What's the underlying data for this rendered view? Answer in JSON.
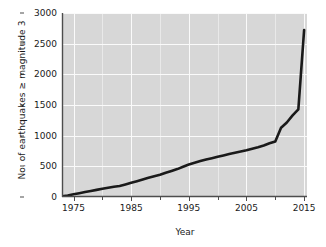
{
  "chart_data": {
    "type": "line",
    "title": "",
    "xlabel": "Year",
    "ylabel": "No. of earthquakes ≥ magnitude 3",
    "xlim": [
      1973,
      2015.5
    ],
    "ylim": [
      0,
      3000
    ],
    "grid": true,
    "legend": null,
    "xticks": [
      1975,
      1985,
      1995,
      2005,
      2015
    ],
    "xticklabels": [
      "1975",
      "1985",
      "1995",
      "2005",
      "2015"
    ],
    "xminorticks": [
      1980,
      1990,
      2000,
      2010
    ],
    "yticks": [
      0,
      500,
      1000,
      1500,
      2000,
      2500,
      3000
    ],
    "yticklabels": [
      "0",
      "500",
      "1000",
      "1500",
      "2000",
      "2500",
      "3000"
    ],
    "series": [
      {
        "name": "Cumulative earthquakes ≥ magnitude 3",
        "color": "#1a1a1a",
        "x": [
          1973,
          1974,
          1975,
          1976,
          1977,
          1978,
          1979,
          1980,
          1981,
          1982,
          1983,
          1984,
          1985,
          1986,
          1987,
          1988,
          1989,
          1990,
          1991,
          1992,
          1993,
          1994,
          1995,
          1996,
          1997,
          1998,
          1999,
          2000,
          2001,
          2002,
          2003,
          2004,
          2005,
          2006,
          2007,
          2008,
          2009,
          2010,
          2011,
          2012,
          2013,
          2014,
          2015
        ],
        "y": [
          10,
          25,
          45,
          62,
          80,
          98,
          116,
          134,
          152,
          168,
          180,
          205,
          232,
          258,
          285,
          312,
          340,
          362,
          395,
          425,
          455,
          492,
          530,
          558,
          585,
          610,
          632,
          655,
          678,
          700,
          722,
          742,
          762,
          788,
          812,
          840,
          875,
          905,
          1130,
          1215,
          1330,
          1430,
          2720
        ]
      }
    ]
  },
  "axes": {
    "x_title": "Year",
    "y_title": "No. of earthquakes ≥ magnitude 3"
  },
  "style": {
    "plot_background": "#d7d7d7",
    "gridline_color": "#ffffff",
    "line_color": "#1a1a1a",
    "axis_color": "#4d4d4d",
    "text_color": "#1a1a1a"
  }
}
